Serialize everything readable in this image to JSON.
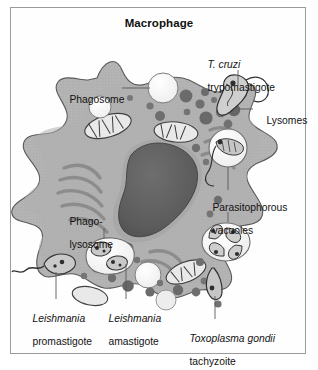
{
  "figure": {
    "title": "Macrophage",
    "kind": "biological-diagram",
    "palette": {
      "frame_border": "#9a9a9a",
      "page_background": "#fefefe",
      "cytoplasm": "#b0b0b0",
      "cytoplasm_edge": "#8d8d8d",
      "cell_outline": "#4a4a4a",
      "nucleus_fill": "#5c5c5c",
      "nucleus_rim": "#a8a8a8",
      "lysosome_dark": "#6b6b6b",
      "lysosome_mid": "#8a8a8a",
      "vacuole_light": "#f7f7f7",
      "vacuole_pale": "#e3e3e3",
      "organelle_gray": "#9c9c9c",
      "leader_line": "#5a5a5a",
      "text": "#121212"
    }
  },
  "labels": [
    {
      "id": "phagosome",
      "lines": [
        {
          "text": "Phagosome",
          "italic": false
        }
      ],
      "x": 58,
      "y": 82,
      "align": "left",
      "leader": {
        "x1": 122,
        "y1": 88,
        "x2": 150,
        "y2": 88
      }
    },
    {
      "id": "t-cruzi-trypomastigote",
      "lines": [
        {
          "text": "T. cruzi",
          "italic": true
        },
        {
          "text": "trypomastigote",
          "italic": false
        }
      ],
      "x": 196,
      "y": 48,
      "align": "left",
      "leader": {
        "x1": 238,
        "y1": 72,
        "x2": 238,
        "y2": 88
      }
    },
    {
      "id": "lysomes",
      "lines": [
        {
          "text": "Lysomes",
          "italic": false
        }
      ],
      "x": 254,
      "y": 104,
      "align": "left",
      "leader": {
        "x1": 236,
        "y1": 109,
        "x2": 252,
        "y2": 109
      }
    },
    {
      "id": "parasitophorous-vacuoles",
      "lines": [
        {
          "text": "Parasitophorous",
          "italic": false
        },
        {
          "text": "vacuoles",
          "italic": false
        }
      ],
      "x": 204,
      "y": 196,
      "align": "left",
      "leaders": [
        {
          "x1": 228,
          "y1": 160,
          "x2": 228,
          "y2": 192
        },
        {
          "x1": 228,
          "y1": 220,
          "x2": 228,
          "y2": 238
        }
      ]
    },
    {
      "id": "phago-lysosome",
      "lines": [
        {
          "text": "Phago-",
          "italic": false
        },
        {
          "text": "lysosome",
          "italic": false
        }
      ],
      "x": 58,
      "y": 209,
      "align": "left",
      "leader": {
        "x1": 104,
        "y1": 240,
        "x2": 104,
        "y2": 262
      }
    },
    {
      "id": "leishmania-promastigote",
      "lines": [
        {
          "text": "Leishmania",
          "italic": true
        },
        {
          "text": "promastigote",
          "italic": false
        }
      ],
      "x": 21,
      "y": 302,
      "align": "left",
      "leader": {
        "x1": 56,
        "y1": 272,
        "x2": 56,
        "y2": 298
      }
    },
    {
      "id": "leishmania-amastigote",
      "lines": [
        {
          "text": "Leishmania",
          "italic": true
        },
        {
          "text": "amastigote",
          "italic": false
        }
      ],
      "x": 97,
      "y": 302,
      "align": "left",
      "leader": {
        "x1": 126,
        "y1": 262,
        "x2": 126,
        "y2": 298
      }
    },
    {
      "id": "toxoplasma-gondii-tachyzoite",
      "lines": [
        {
          "text": "Toxoplasma gondii",
          "italic": true
        },
        {
          "text": "tachyzoite",
          "italic": false
        }
      ],
      "x": 178,
      "y": 322,
      "align": "left",
      "leader": {
        "x1": 215,
        "y1": 295,
        "x2": 215,
        "y2": 318
      }
    }
  ]
}
